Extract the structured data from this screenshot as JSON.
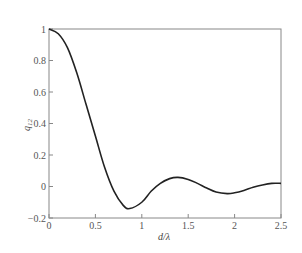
{
  "chart_data": {
    "type": "line",
    "title": "",
    "xlabel": "d/λ",
    "ylabel": "q12",
    "ylabel_main": "q",
    "ylabel_sub": "12",
    "xlim": [
      0,
      2.5
    ],
    "ylim": [
      -0.2,
      1
    ],
    "grid": false,
    "legend": null,
    "x_ticks": [
      0,
      0.5,
      1,
      1.5,
      2,
      2.5
    ],
    "x_tick_labels": [
      "0",
      "0.5",
      "1",
      "1.5",
      "2",
      "2.5"
    ],
    "y_ticks": [
      -0.2,
      0,
      0.2,
      0.4,
      0.6,
      0.8,
      1
    ],
    "y_tick_labels": [
      "−0.2",
      "0",
      "0.2",
      "0.4",
      "0.6",
      "0.8",
      "1"
    ],
    "series": [
      {
        "name": "q12",
        "color": "#222222",
        "x": [
          0,
          0.1,
          0.2,
          0.3,
          0.4,
          0.5,
          0.6,
          0.7,
          0.8,
          0.87,
          1.0,
          1.1,
          1.2,
          1.3,
          1.39,
          1.5,
          1.6,
          1.7,
          1.8,
          1.92,
          2.0,
          2.1,
          2.2,
          2.3,
          2.4,
          2.5
        ],
        "values": [
          1.0,
          0.97,
          0.88,
          0.72,
          0.52,
          0.32,
          0.12,
          -0.03,
          -0.12,
          -0.14,
          -0.1,
          -0.03,
          0.02,
          0.05,
          0.058,
          0.045,
          0.02,
          -0.01,
          -0.035,
          -0.045,
          -0.04,
          -0.025,
          -0.005,
          0.01,
          0.02,
          0.02
        ]
      }
    ]
  }
}
